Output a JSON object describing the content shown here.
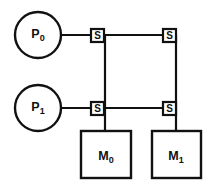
{
  "diagram": {
    "type": "interconnection-network",
    "background_color": "#ffffff",
    "line_color": "#111111",
    "processors": [
      {
        "id": "p0",
        "base": "P",
        "subscript": "0",
        "label": "P0",
        "cx": 38,
        "cy": 35,
        "r": 23
      },
      {
        "id": "p1",
        "base": "P",
        "subscript": "1",
        "label": "P1",
        "cx": 38,
        "cy": 108,
        "r": 23
      }
    ],
    "memories": [
      {
        "id": "m0",
        "base": "M",
        "subscript": "0",
        "label": "M0",
        "x": 81,
        "y": 131,
        "w": 50,
        "h": 47
      },
      {
        "id": "m1",
        "base": "M",
        "subscript": "1",
        "label": "M1",
        "x": 152,
        "y": 131,
        "w": 49,
        "h": 47
      }
    ],
    "switches": [
      {
        "id": "s00",
        "label": "S",
        "x": 91,
        "y": 29,
        "w": 13,
        "h": 13,
        "row": 0,
        "col": 0
      },
      {
        "id": "s01",
        "label": "S",
        "x": 163,
        "y": 29,
        "w": 13,
        "h": 13,
        "row": 0,
        "col": 1
      },
      {
        "id": "s10",
        "label": "S",
        "x": 91,
        "y": 102,
        "w": 13,
        "h": 13,
        "row": 1,
        "col": 0
      },
      {
        "id": "s11",
        "label": "S",
        "x": 163,
        "y": 102,
        "w": 13,
        "h": 13,
        "row": 1,
        "col": 1
      }
    ],
    "links": [
      {
        "id": "bus-p0",
        "from": "p0",
        "to": "s01",
        "orientation": "horizontal",
        "path": "M 61 35 L 176 35"
      },
      {
        "id": "bus-p1",
        "from": "p1",
        "to": "s11",
        "orientation": "horizontal",
        "path": "M 61 108 L 176 108"
      },
      {
        "id": "col-0",
        "from": "s00",
        "to": "m0",
        "orientation": "vertical",
        "path": "M 105 35 L 105 131"
      },
      {
        "id": "col-1",
        "from": "s01",
        "to": "m1",
        "orientation": "vertical",
        "path": "M 176 35 L 176 131"
      }
    ]
  }
}
